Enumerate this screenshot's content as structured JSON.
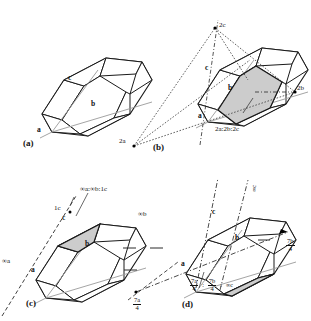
{
  "figure": {
    "type": "crystallographic-diagram",
    "background_color": "#ffffff",
    "line_color": "#1a1a1a",
    "shade_color": "#c9c9c9",
    "axis_line_color": "#8f8f8f"
  },
  "panels": [
    {
      "id": "a",
      "label": "(a)",
      "axis_labels": {
        "a": "a",
        "b": "b",
        "c": "c"
      },
      "annotations": []
    },
    {
      "id": "b",
      "label": "(b)",
      "axis_labels": {
        "a": "a",
        "b": "b",
        "c": "c"
      },
      "intercepts": {
        "a": "2a",
        "b": "2b",
        "c": "2c"
      },
      "parameter_ratio": "2a:2b:2c",
      "annotations": [
        "2c",
        "2b",
        "2a",
        "2a:2b:2c"
      ]
    },
    {
      "id": "c",
      "label": "(c)",
      "axis_labels": {
        "a": "a",
        "b": "b",
        "c": "c"
      },
      "intercepts": {
        "a": "∞a",
        "b": "∞b",
        "c": "1c"
      },
      "parameter_ratio": "∞a:∞b:1c",
      "annotations": [
        "∞a:∞b:1c",
        "1c",
        "∞b",
        "∞a"
      ]
    },
    {
      "id": "d",
      "label": "(d)",
      "axis_labels": {
        "a": "a",
        "b": "b",
        "c": "c"
      },
      "intercepts": {
        "a": {
          "numerator": "7a",
          "denominator": "4"
        },
        "b": {
          "numerator": "7b",
          "denominator": "4"
        },
        "c": "∞c"
      },
      "parameter_ratio_parts": {
        "a_num": "7a",
        "a_den": "4",
        "sep1": ":",
        "b_num": "7b",
        "b_den": "4",
        "sep2": ":",
        "c": "∞c"
      },
      "annotations": [
        "∞c",
        "7a/4",
        "7b/4",
        "7a/4 : 7b/4 : ∞c"
      ]
    }
  ],
  "text": {
    "panel_a_label": "(a)",
    "panel_b_label": "(b)",
    "panel_c_label": "(c)",
    "panel_d_label": "(d)",
    "axis_a": "a",
    "axis_b": "b",
    "axis_c": "c",
    "b_2c": "2c",
    "b_2b": "2b",
    "b_2a": "2a",
    "b_ratio": "2a:2b:2c",
    "c_ratio": "∞a:∞b:1c",
    "c_1c": "1c",
    "c_infb": "∞b",
    "c_infa": "∞a",
    "d_infc_top": "∞c",
    "d_infc_bottom": "∞c",
    "d_7a_num": "7a",
    "d_7b_num": "7b",
    "d_den": "4",
    "d_colon": ":"
  }
}
